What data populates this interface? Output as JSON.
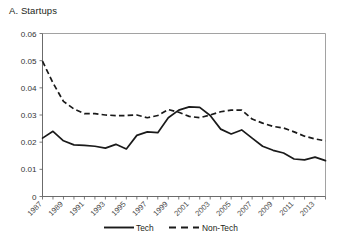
{
  "figure": {
    "panel_title": "A. Startups"
  },
  "chart_data": {
    "type": "line",
    "title": "A. Startups",
    "xlabel": "",
    "ylabel": "",
    "grid": false,
    "legend_position": "bottom-center",
    "xlim": [
      1987,
      2014
    ],
    "ylim": [
      0,
      0.06
    ],
    "ytick_labels": [
      "0",
      "0.01",
      "0.02",
      "0.03",
      "0.04",
      "0.05",
      "0.06"
    ],
    "ytick_values": [
      0,
      0.01,
      0.02,
      0.03,
      0.04,
      0.05,
      0.06
    ],
    "x": [
      1987,
      1988,
      1989,
      1990,
      1991,
      1992,
      1993,
      1994,
      1995,
      1996,
      1997,
      1998,
      1999,
      2000,
      2001,
      2002,
      2003,
      2004,
      2005,
      2006,
      2007,
      2008,
      2009,
      2010,
      2011,
      2012,
      2013,
      2014
    ],
    "xtick_labels": [
      "1987",
      "1989",
      "1991",
      "1993",
      "1995",
      "1997",
      "1999",
      "2001",
      "2003",
      "2005",
      "2007",
      "2009",
      "2011",
      "2013"
    ],
    "xtick_label_values": [
      1987,
      1989,
      1991,
      1993,
      1995,
      1997,
      1999,
      2001,
      2003,
      2005,
      2007,
      2009,
      2011,
      2013
    ],
    "series": [
      {
        "name": "Tech",
        "style": "solid",
        "color": "#1a1a1a",
        "values": [
          0.0215,
          0.024,
          0.0205,
          0.019,
          0.0188,
          0.0185,
          0.0178,
          0.0192,
          0.0175,
          0.0225,
          0.0238,
          0.0235,
          0.029,
          0.0318,
          0.033,
          0.0328,
          0.0298,
          0.0248,
          0.023,
          0.0245,
          0.0215,
          0.0185,
          0.017,
          0.016,
          0.0138,
          0.0135,
          0.0145,
          0.0132
        ]
      },
      {
        "name": "Non-Tech",
        "style": "dashed",
        "color": "#1a1a1a",
        "values": [
          0.0498,
          0.0418,
          0.035,
          0.0322,
          0.0305,
          0.0305,
          0.03,
          0.0298,
          0.0298,
          0.03,
          0.029,
          0.0298,
          0.032,
          0.031,
          0.0295,
          0.029,
          0.03,
          0.0312,
          0.0318,
          0.0318,
          0.0285,
          0.027,
          0.0258,
          0.0252,
          0.0238,
          0.0222,
          0.0212,
          0.0205
        ]
      }
    ],
    "legend": [
      {
        "label": "Tech",
        "style": "solid"
      },
      {
        "label": "Non-Tech",
        "style": "dashed"
      }
    ]
  }
}
